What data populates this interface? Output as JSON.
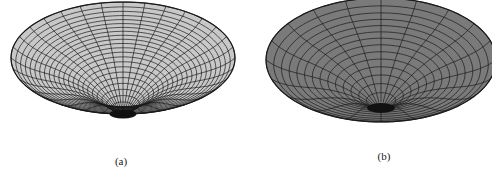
{
  "figure": {
    "panels": [
      {
        "id": "a",
        "caption": "(a)",
        "description": "Light gray funnel-shaped surface with dense radial/circular mesh",
        "fill_color": "#c8c8c8",
        "line_color": "#1a1a1a",
        "rings": 22,
        "spokes": 32
      },
      {
        "id": "b",
        "caption": "(b)",
        "description": "Dark gray smooth funnel-shaped surface with sparser radial/circular mesh",
        "fill_color": "#7a7a7a",
        "line_color": "#1a1a1a",
        "rings": 14,
        "spokes": 20
      }
    ]
  }
}
